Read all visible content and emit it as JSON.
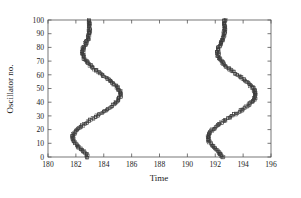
{
  "figure": {
    "background_color": "#ffffff",
    "frame_color": "#555555",
    "marker_color": "#3a3a3a"
  },
  "chart_data": {
    "type": "scatter",
    "title": "",
    "subtitle": "",
    "xlabel": "Time",
    "ylabel": "Oscillator no.",
    "xlim": [
      180,
      196
    ],
    "ylim": [
      0,
      100
    ],
    "xticks": [
      180,
      182,
      184,
      186,
      188,
      190,
      192,
      194,
      196
    ],
    "xticklabels": [
      "180",
      "182",
      "184",
      "186",
      "188",
      "190",
      "192",
      "194",
      "196"
    ],
    "yticks": [
      0,
      10,
      20,
      30,
      40,
      50,
      60,
      70,
      80,
      90,
      100
    ],
    "yticklabels": [
      "0",
      "10",
      "20",
      "30",
      "40",
      "50",
      "60",
      "70",
      "80",
      "90",
      "100"
    ],
    "grid": false,
    "legend": null,
    "legend_position": "none",
    "marker_shape": "open-square",
    "marker_size_px": 2.6,
    "annotations": [],
    "series": [
      {
        "name": "burst-1",
        "x": [
          182.83,
          182.78,
          182.71,
          182.62,
          182.53,
          182.44,
          182.33,
          182.22,
          182.12,
          182.03,
          181.94,
          181.87,
          181.82,
          181.79,
          181.78,
          181.79,
          181.82,
          181.87,
          181.94,
          182.02,
          182.12,
          182.23,
          182.35,
          182.48,
          182.62,
          182.76,
          182.91,
          183.06,
          183.22,
          183.38,
          183.54,
          183.7,
          183.86,
          184.01,
          184.16,
          184.31,
          184.45,
          184.58,
          184.7,
          184.81,
          184.91,
          185.0,
          185.07,
          185.13,
          185.17,
          185.19,
          185.19,
          185.17,
          185.14,
          185.09,
          185.03,
          184.95,
          184.86,
          184.76,
          184.65,
          184.53,
          184.41,
          184.28,
          184.15,
          184.01,
          183.88,
          183.74,
          183.61,
          183.48,
          183.35,
          183.23,
          183.11,
          183.0,
          182.9,
          182.81,
          182.73,
          182.66,
          182.6,
          182.55,
          182.51,
          182.49,
          182.48,
          182.48,
          182.5,
          182.53,
          182.57,
          182.62,
          182.67,
          182.72,
          182.77,
          182.81,
          182.85,
          182.88,
          182.91,
          182.93,
          182.95,
          182.96,
          182.97,
          182.98,
          182.98,
          182.98,
          182.98,
          182.98,
          182.98,
          182.98,
          182.98
        ],
        "y": [
          0,
          1,
          2,
          3,
          4,
          5,
          6,
          7,
          8,
          9,
          10,
          11,
          12,
          13,
          14,
          15,
          16,
          17,
          18,
          19,
          20,
          21,
          22,
          23,
          24,
          25,
          26,
          27,
          28,
          29,
          30,
          31,
          32,
          33,
          34,
          35,
          36,
          37,
          38,
          39,
          40,
          41,
          42,
          43,
          44,
          45,
          46,
          47,
          48,
          49,
          50,
          51,
          52,
          53,
          54,
          55,
          56,
          57,
          58,
          59,
          60,
          61,
          62,
          63,
          64,
          65,
          66,
          67,
          68,
          69,
          70,
          71,
          72,
          73,
          74,
          75,
          76,
          77,
          78,
          79,
          80,
          81,
          82,
          83,
          84,
          85,
          86,
          87,
          88,
          89,
          90,
          91,
          92,
          93,
          94,
          95,
          96,
          97,
          98,
          99,
          100
        ]
      },
      {
        "name": "burst-2",
        "x": [
          192.53,
          192.48,
          192.41,
          192.32,
          192.23,
          192.14,
          192.03,
          191.92,
          191.82,
          191.73,
          191.64,
          191.57,
          191.52,
          191.49,
          191.48,
          191.49,
          191.52,
          191.57,
          191.64,
          191.72,
          191.82,
          191.93,
          192.05,
          192.18,
          192.32,
          192.46,
          192.61,
          192.76,
          192.92,
          193.08,
          193.24,
          193.4,
          193.56,
          193.71,
          193.86,
          194.01,
          194.15,
          194.28,
          194.4,
          194.51,
          194.61,
          194.7,
          194.77,
          194.83,
          194.87,
          194.89,
          194.89,
          194.87,
          194.84,
          194.79,
          194.73,
          194.65,
          194.56,
          194.46,
          194.35,
          194.23,
          194.11,
          193.98,
          193.85,
          193.71,
          193.58,
          193.44,
          193.31,
          193.18,
          193.05,
          192.93,
          192.81,
          192.7,
          192.6,
          192.51,
          192.43,
          192.36,
          192.3,
          192.25,
          192.21,
          192.19,
          192.18,
          192.18,
          192.2,
          192.23,
          192.27,
          192.32,
          192.37,
          192.42,
          192.47,
          192.51,
          192.55,
          192.58,
          192.61,
          192.63,
          192.65,
          192.66,
          192.67,
          192.68,
          192.68,
          192.68,
          192.68,
          192.68,
          192.68,
          192.68,
          192.68
        ],
        "y": [
          0,
          1,
          2,
          3,
          4,
          5,
          6,
          7,
          8,
          9,
          10,
          11,
          12,
          13,
          14,
          15,
          16,
          17,
          18,
          19,
          20,
          21,
          22,
          23,
          24,
          25,
          26,
          27,
          28,
          29,
          30,
          31,
          32,
          33,
          34,
          35,
          36,
          37,
          38,
          39,
          40,
          41,
          42,
          43,
          44,
          45,
          46,
          47,
          48,
          49,
          50,
          51,
          52,
          53,
          54,
          55,
          56,
          57,
          58,
          59,
          60,
          61,
          62,
          63,
          64,
          65,
          66,
          67,
          68,
          69,
          70,
          71,
          72,
          73,
          74,
          75,
          76,
          77,
          78,
          79,
          80,
          81,
          82,
          83,
          84,
          85,
          86,
          87,
          88,
          89,
          90,
          91,
          92,
          93,
          94,
          95,
          96,
          97,
          98,
          99,
          100
        ]
      }
    ],
    "scatter_jitter": {
      "x_spread": 0.085,
      "points_per_oscillator": 3
    }
  }
}
